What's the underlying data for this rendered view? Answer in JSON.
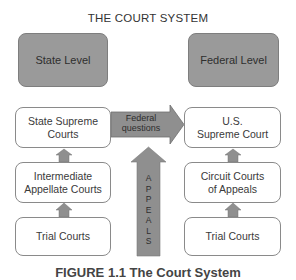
{
  "title": "THE COURT SYSTEM",
  "levels": {
    "state": "State Level",
    "federal": "Federal Level"
  },
  "state_courts": [
    {
      "label": "State Supreme\nCourts"
    },
    {
      "label": "Intermediate\nAppellate Courts"
    },
    {
      "label": "Trial Courts"
    }
  ],
  "federal_courts": [
    {
      "label": "U.S.\nSupreme Court"
    },
    {
      "label": "Circuit Courts\nof Appeals"
    },
    {
      "label": "Trial Courts"
    }
  ],
  "arrows": {
    "federal_questions": "Federal\nquestions",
    "appeals_letters": [
      "A",
      "P",
      "P",
      "E",
      "A",
      "L",
      "S"
    ]
  },
  "caption": "FIGURE 1.1 The Court System",
  "colors": {
    "level_fill": "#9a9a9a",
    "arrow_fill": "#8f8f8f",
    "box_border": "#8a8a8a"
  }
}
